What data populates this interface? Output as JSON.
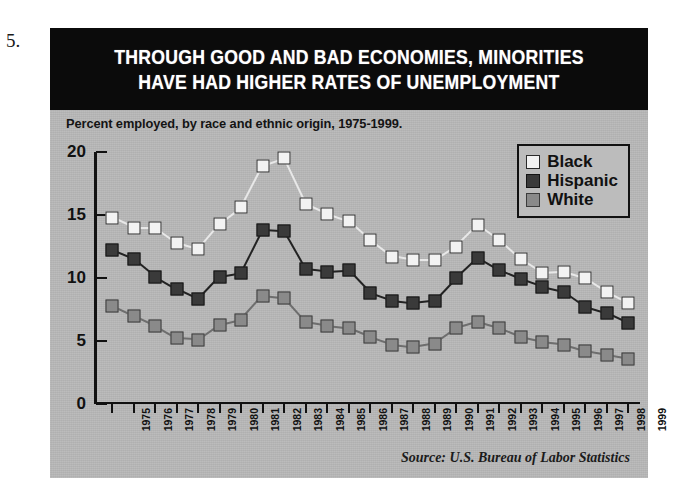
{
  "figure_number": "5.",
  "title": {
    "line1": "THROUGH GOOD AND BAD ECONOMIES, MINORITIES",
    "line2": "HAVE HAD HIGHER RATES OF UNEMPLOYMENT"
  },
  "subtitle": "Percent employed, by race and ethnic origin, 1975-1999.",
  "source": "Source: U.S. Bureau of Labor Statistics",
  "legend": {
    "position": "top-right",
    "items": [
      {
        "label": "Black",
        "color": "#f2f2f2",
        "border": "#2a2a2a"
      },
      {
        "label": "Hispanic",
        "color": "#3a3a3a",
        "border": "#141414"
      },
      {
        "label": "White",
        "color": "#8a8a8a",
        "border": "#3c3c3c"
      }
    ]
  },
  "colors": {
    "panel_background": "#b9b9b9",
    "title_bar": "#0b0b0b",
    "title_text": "#ffffff",
    "axis": "#111111"
  },
  "chart_data": {
    "type": "line",
    "title": "THROUGH GOOD AND BAD ECONOMIES, MINORITIES HAVE HAD HIGHER RATES OF UNEMPLOYMENT",
    "subtitle": "Percent employed, by race and ethnic origin, 1975-1999.",
    "xlabel": "",
    "ylabel": "",
    "ylim": [
      0,
      20
    ],
    "yticks": [
      0,
      5,
      10,
      15,
      20
    ],
    "grid": false,
    "legend_position": "top-right",
    "categories": [
      "1975",
      "1976",
      "1977",
      "1978",
      "1979",
      "1980",
      "1981",
      "1982",
      "1983",
      "1984",
      "1985",
      "1986",
      "1987",
      "1988",
      "1989",
      "1990",
      "1991",
      "1992",
      "1993",
      "1994",
      "1995",
      "1996",
      "1997",
      "1998",
      "1999"
    ],
    "series": [
      {
        "name": "Black",
        "marker": "open-square",
        "color": "#f2f2f2",
        "values": [
          14.8,
          14.0,
          14.0,
          12.8,
          12.3,
          14.3,
          15.6,
          18.9,
          19.5,
          15.9,
          15.1,
          14.5,
          13.0,
          11.7,
          11.4,
          11.4,
          12.5,
          14.2,
          13.0,
          11.5,
          10.4,
          10.5,
          10.0,
          8.9,
          8.0
        ]
      },
      {
        "name": "Hispanic",
        "marker": "filled-square-dark",
        "color": "#3a3a3a",
        "values": [
          12.2,
          11.5,
          10.1,
          9.1,
          8.3,
          10.1,
          10.4,
          13.8,
          13.7,
          10.7,
          10.5,
          10.6,
          8.8,
          8.2,
          8.0,
          8.2,
          10.0,
          11.6,
          10.6,
          9.9,
          9.3,
          8.9,
          7.7,
          7.2,
          6.4
        ]
      },
      {
        "name": "White",
        "marker": "filled-square-gray",
        "color": "#8a8a8a",
        "values": [
          7.8,
          7.0,
          6.2,
          5.2,
          5.1,
          6.3,
          6.7,
          8.6,
          8.4,
          6.5,
          6.2,
          6.0,
          5.3,
          4.7,
          4.5,
          4.8,
          6.0,
          6.5,
          6.0,
          5.3,
          4.9,
          4.7,
          4.2,
          3.9,
          3.6
        ]
      }
    ]
  }
}
